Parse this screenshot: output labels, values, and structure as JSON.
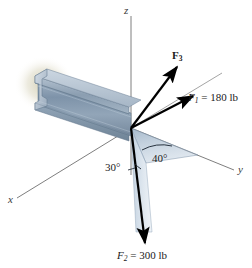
{
  "figure": {
    "background_color": "#ffffff"
  },
  "axes": {
    "x_label": "x",
    "y_label": "y",
    "z_label": "z",
    "line_color": "#6a6a6a"
  },
  "forces": [
    {
      "name": "F1",
      "label_prefix": "F",
      "label_sub": "1",
      "label_value": " = 180 lb",
      "full_label": "F1 = 180 lb",
      "magnitude": 180,
      "unit": "lb",
      "color": "#000000"
    },
    {
      "name": "F2",
      "label_prefix": "F",
      "label_sub": "2",
      "label_value": " = 300 lb",
      "full_label": "F2 = 300 lb",
      "magnitude": 300,
      "unit": "lb",
      "color": "#000000"
    },
    {
      "name": "F3",
      "label_prefix": "F",
      "label_sub": "3",
      "label_value": "",
      "full_label": "F3",
      "magnitude": null,
      "unit": "",
      "color": "#000000"
    }
  ],
  "angles": [
    {
      "name": "angle-30",
      "label": "30°",
      "value": 30
    },
    {
      "name": "angle-40",
      "label": "40°",
      "value": 40
    }
  ],
  "beam": {
    "type": "I-beam",
    "face_color": "#8ea3b8",
    "top_color": "#b9c6d4",
    "edge_color": "#5d7085"
  },
  "shaded_plane": {
    "name": "projection-plane",
    "fill_color": "#9fb4c9",
    "opacity": 0.55
  },
  "smudge": {
    "name": "wall-shadow",
    "color": "#b3ad7e"
  }
}
